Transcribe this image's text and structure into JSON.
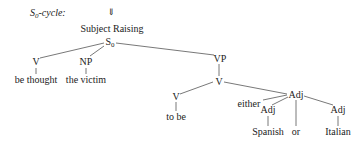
{
  "header": {
    "cycle_label": "S",
    "cycle_sub": "0",
    "cycle_suffix": "-cycle:",
    "arrow": "⇓",
    "rule": "Subject Raising"
  },
  "tree": {
    "root": {
      "label": "S",
      "sub": "0"
    },
    "left_v": {
      "label": "V",
      "word": "be thought"
    },
    "np": {
      "label": "NP",
      "word": "the victim"
    },
    "vp": {
      "label": "VP"
    },
    "v_mid": {
      "label": "V"
    },
    "v_low": {
      "label": "V",
      "word": "to be"
    },
    "adj_top": {
      "label": "Adj"
    },
    "either": "either",
    "adj_left": {
      "label": "Adj",
      "word": "Spanish"
    },
    "or": "or",
    "adj_right": {
      "label": "Adj",
      "word": "Italian"
    }
  },
  "colors": {
    "line": "#555555",
    "text": "#222222"
  }
}
